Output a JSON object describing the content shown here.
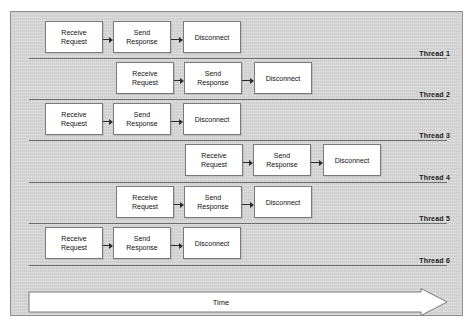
{
  "diagram": {
    "type": "swimlane-timeline",
    "colors": {
      "panel_background": "#d2d2d2",
      "panel_border": "#8d8d8d",
      "lane_line": "#6e6e6e",
      "box_fill": "#ffffff",
      "box_border": "#7a7a7a",
      "arrow": "#2b2b2b",
      "text": "#111111"
    },
    "steps": {
      "receive_request_line1": "Receive",
      "receive_request_line2": "Request",
      "send_response_line1": "Send",
      "send_response_line2": "Response",
      "disconnect": "Disconnect"
    },
    "lanes": [
      {
        "id": "thread-1",
        "label": "Thread 1",
        "start_offset": 34,
        "boxes": [
          {
            "name": "receive-request",
            "x": 34,
            "width": 58,
            "lines": [
              "Receive",
              "Request"
            ]
          },
          {
            "name": "send-response",
            "x": 102,
            "width": 58,
            "lines": [
              "Send",
              "Response"
            ]
          },
          {
            "name": "disconnect",
            "x": 172,
            "width": 58,
            "lines": [
              "Disconnect"
            ]
          }
        ]
      },
      {
        "id": "thread-2",
        "label": "Thread 2",
        "start_offset": 105,
        "boxes": [
          {
            "name": "receive-request",
            "x": 105,
            "width": 58,
            "lines": [
              "Receive",
              "Request"
            ]
          },
          {
            "name": "send-response",
            "x": 173,
            "width": 58,
            "lines": [
              "Send",
              "Response"
            ]
          },
          {
            "name": "disconnect",
            "x": 243,
            "width": 58,
            "lines": [
              "Disconnect"
            ]
          }
        ]
      },
      {
        "id": "thread-3",
        "label": "Thread 3",
        "start_offset": 34,
        "boxes": [
          {
            "name": "receive-request",
            "x": 34,
            "width": 58,
            "lines": [
              "Receive",
              "Request"
            ]
          },
          {
            "name": "send-response",
            "x": 102,
            "width": 58,
            "lines": [
              "Send",
              "Response"
            ]
          },
          {
            "name": "disconnect",
            "x": 172,
            "width": 58,
            "lines": [
              "Disconnect"
            ]
          }
        ]
      },
      {
        "id": "thread-4",
        "label": "Thread 4",
        "start_offset": 174,
        "boxes": [
          {
            "name": "receive-request",
            "x": 174,
            "width": 58,
            "lines": [
              "Receive",
              "Request"
            ]
          },
          {
            "name": "send-response",
            "x": 242,
            "width": 58,
            "lines": [
              "Send",
              "Response"
            ]
          },
          {
            "name": "disconnect",
            "x": 312,
            "width": 58,
            "lines": [
              "Disconnect"
            ]
          }
        ]
      },
      {
        "id": "thread-5",
        "label": "Thread 5",
        "start_offset": 105,
        "boxes": [
          {
            "name": "receive-request",
            "x": 105,
            "width": 58,
            "lines": [
              "Receive",
              "Request"
            ]
          },
          {
            "name": "send-response",
            "x": 173,
            "width": 58,
            "lines": [
              "Send",
              "Response"
            ]
          },
          {
            "name": "disconnect",
            "x": 243,
            "width": 58,
            "lines": [
              "Disconnect"
            ]
          }
        ]
      },
      {
        "id": "thread-6",
        "label": "Thread 6",
        "start_offset": 34,
        "boxes": [
          {
            "name": "receive-request",
            "x": 34,
            "width": 58,
            "lines": [
              "Receive",
              "Request"
            ]
          },
          {
            "name": "send-response",
            "x": 102,
            "width": 58,
            "lines": [
              "Send",
              "Response"
            ]
          },
          {
            "name": "disconnect",
            "x": 172,
            "width": 58,
            "lines": [
              "Disconnect"
            ]
          }
        ]
      }
    ],
    "axis": {
      "label": "Time",
      "direction": "left-to-right"
    }
  }
}
